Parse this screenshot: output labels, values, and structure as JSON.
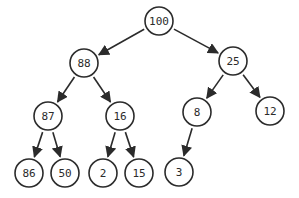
{
  "diagram": {
    "type": "binary-tree",
    "colors": {
      "stroke": "#2b2b2b",
      "fill": "#ffffff",
      "text": "#2b2b2b"
    },
    "node_radius": 14,
    "nodes": [
      {
        "id": "n100",
        "label": "100",
        "x": 159,
        "y": 21
      },
      {
        "id": "n88",
        "label": "88",
        "x": 84,
        "y": 63
      },
      {
        "id": "n25",
        "label": "25",
        "x": 233,
        "y": 61
      },
      {
        "id": "n87",
        "label": "87",
        "x": 48,
        "y": 116
      },
      {
        "id": "n16",
        "label": "16",
        "x": 120,
        "y": 116
      },
      {
        "id": "n8",
        "label": "8",
        "x": 197,
        "y": 112
      },
      {
        "id": "n12",
        "label": "12",
        "x": 270,
        "y": 111
      },
      {
        "id": "n86",
        "label": "86",
        "x": 29,
        "y": 173
      },
      {
        "id": "n50",
        "label": "50",
        "x": 65,
        "y": 173
      },
      {
        "id": "n2",
        "label": "2",
        "x": 103,
        "y": 173
      },
      {
        "id": "n15",
        "label": "15",
        "x": 139,
        "y": 173
      },
      {
        "id": "n3",
        "label": "3",
        "x": 179,
        "y": 172
      }
    ],
    "edges": [
      {
        "from": "n100",
        "to": "n88"
      },
      {
        "from": "n100",
        "to": "n25"
      },
      {
        "from": "n88",
        "to": "n87"
      },
      {
        "from": "n88",
        "to": "n16"
      },
      {
        "from": "n25",
        "to": "n8"
      },
      {
        "from": "n25",
        "to": "n12"
      },
      {
        "from": "n87",
        "to": "n86"
      },
      {
        "from": "n87",
        "to": "n50"
      },
      {
        "from": "n16",
        "to": "n2"
      },
      {
        "from": "n16",
        "to": "n15"
      },
      {
        "from": "n8",
        "to": "n3"
      }
    ]
  }
}
